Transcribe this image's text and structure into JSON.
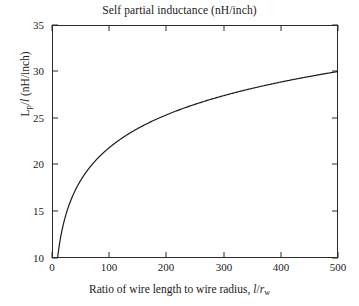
{
  "figure": {
    "title": "Self partial inductance (nH/inch)",
    "background_color": "#ffffff",
    "axis_color": "#2a2a2a",
    "curve_color": "#1a1a1a",
    "xlabel_prefix": "Ratio of wire length to wire radius, ",
    "xlabel_l": "l",
    "xlabel_slash": "/",
    "xlabel_r": "r",
    "xlabel_sub_w": "w",
    "ylabel_L": "L",
    "ylabel_sub_p": "p",
    "ylabel_slash": "/",
    "ylabel_l": "l",
    "ylabel_units": " (nH/inch)"
  },
  "chart_data": {
    "type": "line",
    "title": "Self partial inductance (nH/inch)",
    "xlabel": "Ratio of wire length to wire radius, l/rw",
    "ylabel": "Lp/l (nH/inch)",
    "xlim": [
      0,
      500
    ],
    "ylim": [
      10,
      35
    ],
    "xticks": [
      0,
      100,
      200,
      300,
      400,
      500
    ],
    "yticks": [
      10,
      15,
      20,
      25,
      30,
      35
    ],
    "xtick_labels": [
      "0",
      "100",
      "200",
      "300",
      "400",
      "500"
    ],
    "ytick_labels": [
      "10",
      "15",
      "20",
      "25",
      "30",
      "35"
    ],
    "grid": false,
    "legend": null,
    "series": [
      {
        "name": "Lp/l",
        "formula": "5.08*(ln(2*x) - 1.0)",
        "x": [
          6,
          8,
          10,
          12,
          15,
          20,
          25,
          30,
          40,
          50,
          60,
          70,
          80,
          90,
          100,
          120,
          140,
          160,
          180,
          200,
          225,
          250,
          275,
          300,
          325,
          350,
          375,
          400,
          425,
          450,
          475,
          500
        ],
        "y": [
          7.6,
          10.0,
          11.2,
          12.1,
          13.3,
          14.7,
          15.8,
          16.8,
          18.3,
          19.4,
          20.3,
          21.1,
          21.8,
          22.4,
          22.9,
          23.8,
          24.6,
          25.3,
          25.9,
          26.4,
          27.0,
          27.5,
          28.0,
          28.5,
          28.9,
          29.2,
          29.6,
          29.9,
          30.2,
          30.5,
          30.8,
          31.0
        ]
      }
    ]
  }
}
